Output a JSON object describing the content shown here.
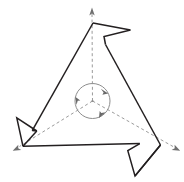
{
  "figure": {
    "title": "Pinwheel figure with three-fold rotational symmetry",
    "caption": "",
    "background_color": "#ffffff",
    "outline_color": "#231f20",
    "axis_color": "#9b9b9b",
    "rotation_marker_color": "#8d8d8d",
    "arrow_head_color": "#6f6f6f",
    "canvas": {
      "width": 184,
      "height": 182
    },
    "symmetry": {
      "order": 3,
      "label": "C3",
      "center": {
        "x": 92.5,
        "y": 101
      }
    },
    "outline": {
      "name": "pinwheel-polygon",
      "closed": true,
      "stroke_width": 1.5,
      "points": "93,23 130,30 104,36.5 105.5,44.5 160.5,145 139.5,143.5 127.5,150.5 135,176 160.5,145 23,146.5 36.5,131 17,118 23,146.5",
      "path": "M 93 23 L 130 30 L 104 36.5 L 105.5 44.5 L 160.5 145 L 139.5 143.5 L 127.5 150.5 L 135 176 L 160.5 145 M 160.5 145 L 23 146.5 L 36.5 131 L 17 118 L 23 146.5 L 93 23"
    },
    "axes": [
      {
        "name": "axis-top",
        "from": {
          "x": 92.5,
          "y": 101
        },
        "to": {
          "x": 92.0,
          "y": 12
        },
        "arrow_at": "to",
        "direction": "up"
      },
      {
        "name": "axis-bottom-left",
        "from": {
          "x": 92.5,
          "y": 101
        },
        "to": {
          "x": 16.5,
          "y": 148
        },
        "arrow_at": "to",
        "direction": "down-left"
      },
      {
        "name": "axis-bottom-right",
        "from": {
          "x": 92.5,
          "y": 101
        },
        "to": {
          "x": 176.5,
          "y": 148
        },
        "arrow_at": "to",
        "direction": "down-right"
      }
    ],
    "rotation_marker": {
      "name": "rotation-circle",
      "center": {
        "x": 92.5,
        "y": 101
      },
      "radius": 17.5,
      "arrow_count": 3,
      "arrow_angles_deg": [
        300,
        60,
        180
      ],
      "sense": "counterclockwise"
    }
  }
}
